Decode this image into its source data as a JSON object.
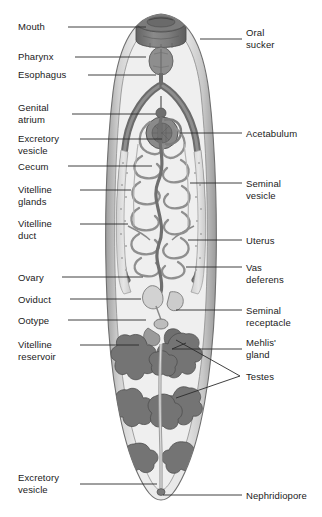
{
  "diagram": {
    "view": "ventral whole-mount, anterior at top",
    "style": "grayscale line drawing with stippled shading",
    "colors": {
      "background": "#ffffff",
      "label_text": "#1a1a1a",
      "leader_line": "#2b2b2b",
      "body_outline": "#6f6f6f",
      "body_fill_light": "#e3e3e3",
      "tegument_band": "#c9c9c9",
      "parenchyma": "#efefef",
      "organ_dark": "#6e6e6e",
      "organ_mid": "#9c9c9c",
      "organ_light": "#d6d6d6",
      "sucker_dark": "#707070",
      "testes": "#747474",
      "vitelline": "#dcdcdc"
    }
  },
  "labels_left": [
    {
      "id": "mouth",
      "text": "Mouth",
      "x": 18,
      "y": 21,
      "line_from_x": 68,
      "line_y": 27,
      "line_to_x": 146
    },
    {
      "id": "pharynx",
      "text": "Pharynx",
      "x": 18,
      "y": 51,
      "line_from_x": 75,
      "line_y": 57,
      "line_to_x": 146
    },
    {
      "id": "esophagus",
      "text": "Esophagus",
      "x": 18,
      "y": 69,
      "line_from_x": 88,
      "line_y": 75,
      "line_to_x": 156
    },
    {
      "id": "genital-atrium",
      "text": "Genital\natrium",
      "x": 18,
      "y": 102,
      "line_from_x": 72,
      "line_y": 114,
      "line_to_x": 156
    },
    {
      "id": "excretory-vesicle-1",
      "text": "Excretory\nvesicle",
      "x": 18,
      "y": 133,
      "line_from_x": 80,
      "line_y": 139,
      "line_to_x": 162
    },
    {
      "id": "cecum",
      "text": "Cecum",
      "x": 18,
      "y": 161,
      "line_from_x": 68,
      "line_y": 166,
      "line_to_x": 152
    },
    {
      "id": "vitelline-glands",
      "text": "Vitelline\nglands",
      "x": 18,
      "y": 184,
      "line_from_x": 80,
      "line_y": 190,
      "line_to_x": 131
    },
    {
      "id": "vitelline-duct",
      "text": "Vitelline\nduct",
      "x": 18,
      "y": 218,
      "line_from_x": 80,
      "line_y": 224,
      "line_to_x": 128
    },
    {
      "id": "ovary",
      "text": "Ovary",
      "x": 18,
      "y": 272,
      "line_from_x": 62,
      "line_y": 277,
      "line_to_x": 143
    },
    {
      "id": "oviduct",
      "text": "Oviduct",
      "x": 18,
      "y": 294,
      "line_from_x": 70,
      "line_y": 299,
      "line_to_x": 141
    },
    {
      "id": "ootype",
      "text": "Ootype",
      "x": 18,
      "y": 315,
      "line_from_x": 68,
      "line_y": 320,
      "line_to_x": 146
    },
    {
      "id": "vitelline-reservoir",
      "text": "Vitelline\nreservoir",
      "x": 18,
      "y": 339,
      "line_from_x": 80,
      "line_y": 345,
      "line_to_x": 139
    },
    {
      "id": "excretory-vesicle-2",
      "text": "Excretory\nvesicle",
      "x": 18,
      "y": 472,
      "line_from_x": 80,
      "line_y": 484,
      "line_to_x": 157
    }
  ],
  "labels_right": [
    {
      "id": "oral-sucker",
      "text": "Oral\nsucker",
      "x": 246,
      "y": 27,
      "line_from_x": 200,
      "line_y": 39,
      "line_to_x": 242
    },
    {
      "id": "acetabulum",
      "text": "Acetabulum",
      "x": 246,
      "y": 128,
      "line_from_x": 180,
      "line_y": 133,
      "line_to_x": 242
    },
    {
      "id": "seminal-vesicle",
      "text": "Seminal\nvesicle",
      "x": 246,
      "y": 178,
      "line_from_x": 190,
      "line_y": 183,
      "line_to_x": 242
    },
    {
      "id": "uterus",
      "text": "Uterus",
      "x": 246,
      "y": 235,
      "line_from_x": 188,
      "line_y": 240,
      "line_to_x": 242
    },
    {
      "id": "vas-deferens",
      "text": "Vas\ndeferens",
      "x": 246,
      "y": 262,
      "line_from_x": 186,
      "line_y": 267,
      "line_to_x": 242
    },
    {
      "id": "seminal-receptacle",
      "text": "Seminal\nreceptacle",
      "x": 246,
      "y": 305,
      "line_from_x": 176,
      "line_y": 310,
      "line_to_x": 242
    },
    {
      "id": "mehlis-gland",
      "text": "Mehlis'\ngland",
      "x": 246,
      "y": 337,
      "line_from_x": 172,
      "line_y": 349,
      "line_to_x": 242
    },
    {
      "id": "testes",
      "text": "Testes",
      "x": 246,
      "y": 371,
      "line_from_x": 240,
      "line_y": 376,
      "line_to_x": 242
    },
    {
      "id": "nephridiopore",
      "text": "Nephridiopore",
      "x": 246,
      "y": 490,
      "line_from_x": 163,
      "line_y": 495,
      "line_to_x": 242
    }
  ],
  "testes_bracket": {
    "apex_x": 240,
    "apex_y": 376,
    "upper_end_x": 176,
    "upper_end_y": 340,
    "lower_end_x": 176,
    "lower_end_y": 398
  },
  "structures": [
    {
      "id": "body",
      "name": "body outline"
    },
    {
      "id": "oral-sucker",
      "name": "oral sucker"
    },
    {
      "id": "pharynx",
      "name": "pharynx"
    },
    {
      "id": "esophagus",
      "name": "esophagus"
    },
    {
      "id": "cecum-left",
      "name": "left cecum"
    },
    {
      "id": "cecum-right",
      "name": "right cecum"
    },
    {
      "id": "acetabulum",
      "name": "acetabulum (ventral sucker)"
    },
    {
      "id": "uterus",
      "name": "coiled uterus"
    },
    {
      "id": "vitelline-glands",
      "name": "vitelline glands"
    },
    {
      "id": "ovary",
      "name": "ovary"
    },
    {
      "id": "testes",
      "name": "branched testes"
    },
    {
      "id": "excretory-vesicle",
      "name": "excretory vesicle"
    }
  ]
}
